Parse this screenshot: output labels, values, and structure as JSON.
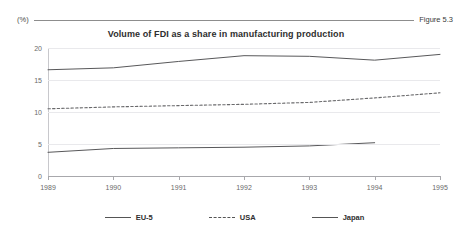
{
  "header": {
    "unit_label": "(%)",
    "figure_number": "Figure 5.3"
  },
  "chart_data": {
    "type": "line",
    "title": "Volume of FDI as a share in manufacturing production",
    "xlabel": "",
    "ylabel": "(%)",
    "ylim": [
      0,
      20
    ],
    "yticks": [
      0,
      5,
      10,
      15,
      20
    ],
    "grid": true,
    "legend_position": "bottom",
    "x": [
      1989,
      1990,
      1991,
      1992,
      1993,
      1994,
      1995
    ],
    "categories": [
      "1989",
      "1990",
      "1991",
      "1992",
      "1993",
      "1994",
      "1995"
    ],
    "series": [
      {
        "name": "EU-5",
        "style": "solid",
        "color": "#58585a",
        "values": [
          16.6,
          16.9,
          17.9,
          18.8,
          18.7,
          18.1,
          19.0
        ]
      },
      {
        "name": "USA",
        "style": "dashed",
        "color": "#6a6a6c",
        "values": [
          10.5,
          10.8,
          11.0,
          11.2,
          11.5,
          12.2,
          13.0
        ]
      },
      {
        "name": "Japan",
        "style": "solid",
        "color": "#58585a",
        "values": [
          3.7,
          4.3,
          4.4,
          4.5,
          4.7,
          5.2,
          null
        ]
      }
    ]
  },
  "legend": [
    {
      "label": "EU-5",
      "style": "solid"
    },
    {
      "label": "USA",
      "style": "dashed"
    },
    {
      "label": "Japan",
      "style": "solid"
    }
  ]
}
